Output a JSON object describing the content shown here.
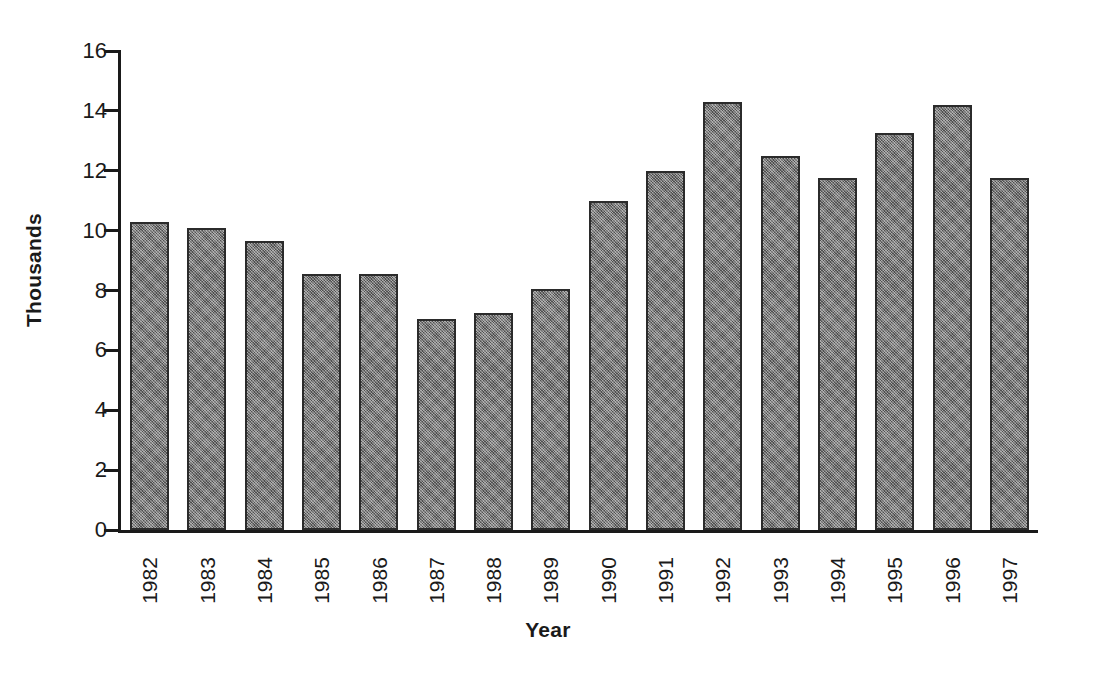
{
  "chart_data": {
    "type": "bar",
    "title": "",
    "xlabel": "Year",
    "ylabel": "Thousands",
    "categories": [
      "1982",
      "1983",
      "1984",
      "1985",
      "1986",
      "1987",
      "1988",
      "1989",
      "1990",
      "1991",
      "1992",
      "1993",
      "1994",
      "1995",
      "1996",
      "1997"
    ],
    "values": [
      10.3,
      10.1,
      9.65,
      8.55,
      8.55,
      7.05,
      7.25,
      8.05,
      11.0,
      12.0,
      14.3,
      12.5,
      11.75,
      13.25,
      14.2,
      11.75
    ],
    "ylim": [
      0,
      16
    ],
    "ytick_values": [
      0,
      2,
      4,
      6,
      8,
      10,
      12,
      14,
      16
    ],
    "ytick_labels": [
      "0",
      "2",
      "4",
      "6",
      "8",
      "10",
      "12",
      "14",
      "16"
    ],
    "grid": false,
    "legend": false,
    "legend_position": "none",
    "bar_color": "#6d6d6d",
    "bar_edge_color": "#2b2b2b",
    "axis_color": "#1a1a1a",
    "background_color": "#ffffff",
    "series": [
      {
        "name": "Thousands",
        "values": [
          10.3,
          10.1,
          9.65,
          8.55,
          8.55,
          7.05,
          7.25,
          8.05,
          11.0,
          12.0,
          14.3,
          12.5,
          11.75,
          13.25,
          14.2,
          11.75
        ]
      }
    ]
  }
}
